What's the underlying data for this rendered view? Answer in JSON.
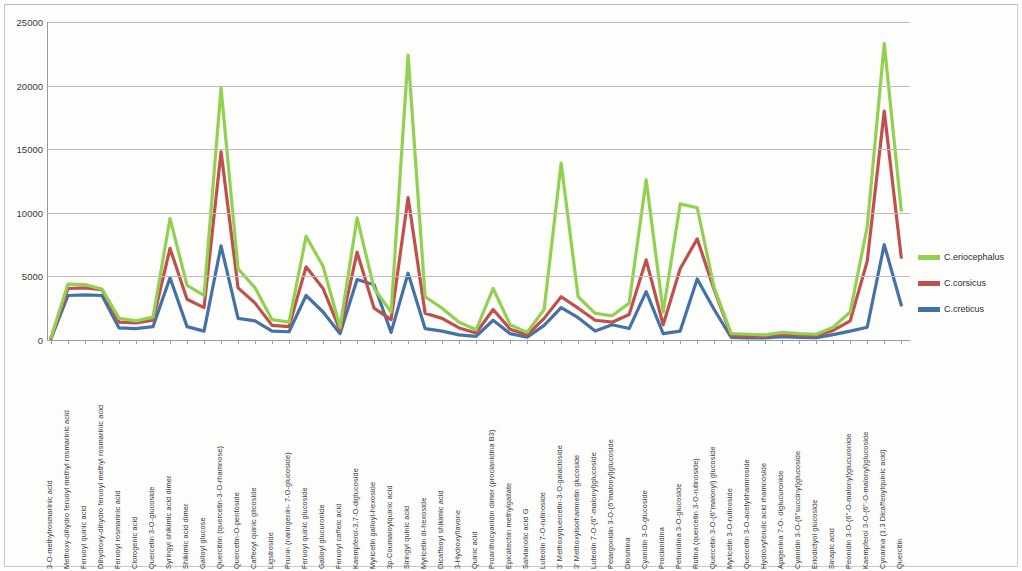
{
  "chart_data": {
    "type": "line",
    "title": "",
    "xlabel": "",
    "ylabel": "",
    "ylim": [
      0,
      25000
    ],
    "ytick_labels": [
      "0",
      "5000",
      "10000",
      "15000",
      "20000",
      "25000"
    ],
    "yticks": [
      0,
      5000,
      10000,
      15000,
      20000,
      25000
    ],
    "grid": true,
    "legend_position": "right",
    "categories": [
      "3-O-methylrosmarinic acid",
      "Methoxy-dihydro feruoyl methyl rosmarinic acid",
      "Feruoyl quinic acid",
      "Dihydroxy-dihydro feruoyl methyl rosmarinic acid",
      "Feruoyl rosmarinic acid",
      "Clorogenic acid",
      "Quercetin 3-O-glucoside",
      "Syringyl shikimic acid dimer",
      "Shikimic acid dimer",
      "Galloyl glucose",
      "Quercitrin (quercetin-3-O-rhamnose)",
      "Quercetin-O-pentoside",
      "Caffeoyl quinic glicoside",
      "Ligstroside",
      "Prunin (naringenin- 7-O-glucoside)",
      "Feruoyl quinic glucoside",
      "Galloyl glucuronide",
      "Feruoyl caffeic acid",
      "Kaempferol-3,7-O-diglucoside",
      "Myricetin galloyl-hexoside",
      "3p-Coumaroylquinic acid",
      "Siringyl quinic acid",
      "Myricetin di-hexoside",
      "Dicaffeoyl shikimic acid",
      "3-Hydroxyflavone",
      "Quinic acid",
      "Proanthocyanidin dimer (procianidina B3)",
      "Epicatechin methylgallate",
      "Salvianolic acid G",
      "Luteolin 7-O-rutinoside",
      "3' Methoxyquercetin-3-O-galactoside",
      "3' Methoxyisorhamnetin glucoside",
      "Luteolin 7-O-(6\"-malonyl)glucoside",
      "Pelargonidin 3-O-(6\"malonyl)glucoside",
      "Diosmina",
      "Cyanidin 3-O-glucoside",
      "Procianidina",
      "Petunidina 3-O-glucoside",
      "Rutina (quercetin 3-O-rutinoside)",
      "Quercetin 3-O-(6\"malonyl) glucoside",
      "Myricetin 3-O-rutinoside",
      "Quercetin 3-O-acetylrhamnoside",
      "Hydroxyferulic acid rhamnoside",
      "Apigenina 7-O- diglucuronide",
      "Cyanidin 3-O-(6\"succinyl)glucoside",
      "Eriodictyol glucoside",
      "Sinapic acid",
      "Peonidin 3-O-(6\"-O-malonyl)glucuronide",
      "Kaempferol 3-O-(6\"-O-malonyl)glucoside",
      "Cynarina (1,3 Dicaffeoylquinic acid)",
      "Quercitin"
    ],
    "series": [
      {
        "name": "C.eriocephalus",
        "color": "#92D050",
        "values": [
          200,
          4400,
          4350,
          4000,
          1700,
          1500,
          1800,
          9550,
          4300,
          3500,
          19800,
          5600,
          4100,
          1600,
          1400,
          8150,
          5800,
          1000,
          9600,
          4050,
          2200,
          22400,
          3400,
          2500,
          1400,
          800,
          4050,
          1200,
          600,
          2400,
          13900,
          3400,
          2100,
          1900,
          2900,
          12600,
          2200,
          10700,
          10400,
          4100,
          500,
          450,
          400,
          600,
          500,
          450,
          1000,
          2200,
          8900,
          23300,
          10200
        ]
      },
      {
        "name": "C.corsicus",
        "color": "#C0504D",
        "values": [
          150,
          4050,
          4100,
          3950,
          1400,
          1350,
          1550,
          7200,
          3200,
          2550,
          14800,
          4100,
          2900,
          1150,
          1050,
          5750,
          4050,
          750,
          6900,
          2500,
          1600,
          11200,
          2100,
          1700,
          950,
          550,
          2400,
          850,
          400,
          1700,
          3400,
          2500,
          1550,
          1400,
          2000,
          6300,
          1200,
          5600,
          7950,
          3950,
          350,
          300,
          300,
          450,
          380,
          350,
          750,
          1500,
          6200,
          18000,
          6500
        ]
      },
      {
        "name": "C.creticus",
        "color": "#4472A8",
        "values": [
          100,
          3500,
          3550,
          3500,
          950,
          900,
          1050,
          4900,
          1050,
          700,
          7400,
          1700,
          1500,
          700,
          650,
          3500,
          2200,
          500,
          4750,
          4350,
          600,
          5250,
          900,
          700,
          400,
          280,
          1550,
          500,
          220,
          1150,
          2550,
          1750,
          700,
          1200,
          900,
          3800,
          500,
          700,
          4800,
          2400,
          200,
          170,
          170,
          260,
          210,
          190,
          420,
          700,
          1000,
          7500,
          2750
        ]
      }
    ]
  },
  "legend": {
    "items": [
      {
        "label": "C.eriocephalus",
        "color": "#92D050"
      },
      {
        "label": "C.corsicus",
        "color": "#C0504D"
      },
      {
        "label": "C.creticus",
        "color": "#4472A8"
      }
    ]
  }
}
